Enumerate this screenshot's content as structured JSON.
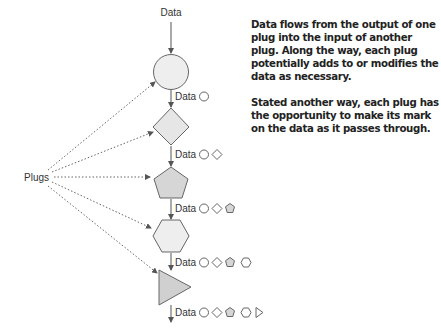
{
  "diagram": {
    "top_label": "Data",
    "side_label": "Plugs",
    "data_label": "Data",
    "plugs": [
      {
        "shape": "circle",
        "fill": "#eeeeee"
      },
      {
        "shape": "diamond",
        "fill": "#e6e6e6"
      },
      {
        "shape": "pentagon",
        "fill": "#d6d6d6"
      },
      {
        "shape": "hexagon",
        "fill": "#eeeeee"
      },
      {
        "shape": "triangle",
        "fill": "#d0d0d0"
      }
    ],
    "data_rows": [
      {
        "label": "Data",
        "marks": [
          "circle"
        ]
      },
      {
        "label": "Data",
        "marks": [
          "circle",
          "diamond"
        ]
      },
      {
        "label": "Data",
        "marks": [
          "circle",
          "diamond",
          "pentagon"
        ]
      },
      {
        "label": "Data",
        "marks": [
          "circle",
          "diamond",
          "pentagon",
          "hexagon"
        ]
      },
      {
        "label": "Data",
        "marks": [
          "circle",
          "diamond",
          "pentagon",
          "hexagon",
          "triangle"
        ]
      }
    ],
    "colors": {
      "stroke": "#555555",
      "text": "#222222"
    }
  },
  "note": {
    "paragraph_1": "Data flows from the output of one plug into the input of another plug. Along the way, each plug potentially adds to or modifies the data as necessary.",
    "paragraph_2": "Stated another way, each plug has the opportunity to make its mark on the data as it passes through."
  }
}
